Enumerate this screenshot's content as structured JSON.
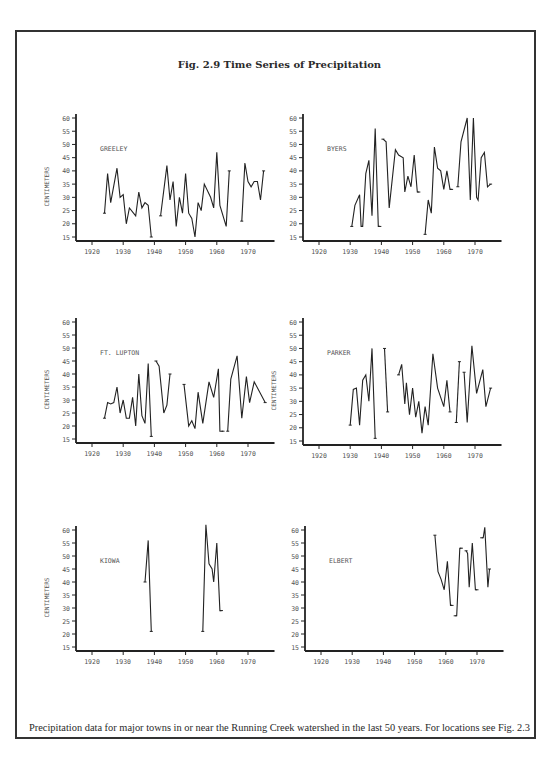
{
  "figure": {
    "title": "Fig. 2.9 Time Series of Precipitation",
    "caption": "Precipitation data for major towns in or near the Running Creek watershed in the last 50 years. For locations see Fig. 2.3"
  },
  "chart_data": [
    {
      "type": "line",
      "title": "GREELEY",
      "xlabel": "",
      "ylabel": "CENTIMETERS",
      "show_ylabel": true,
      "xlim": [
        1915,
        1978
      ],
      "ylim": [
        13,
        61
      ],
      "xticks": [
        1920,
        1930,
        1940,
        1950,
        1960,
        1970
      ],
      "yticks": [
        15,
        20,
        25,
        30,
        35,
        40,
        45,
        50,
        55,
        60
      ],
      "grid": false,
      "segments": [
        [
          [
            1924,
            24
          ],
          [
            1925,
            39
          ],
          [
            1926,
            28
          ],
          [
            1928,
            41
          ],
          [
            1929,
            30
          ],
          [
            1930,
            31
          ],
          [
            1931,
            20
          ],
          [
            1932,
            26
          ],
          [
            1934,
            23
          ],
          [
            1935,
            32
          ],
          [
            1936,
            26
          ],
          [
            1937,
            28
          ],
          [
            1938,
            27
          ],
          [
            1939,
            15
          ]
        ],
        [
          [
            1942,
            23
          ],
          [
            1944,
            42
          ],
          [
            1945,
            29
          ],
          [
            1946,
            36
          ],
          [
            1947,
            19
          ],
          [
            1948,
            30
          ],
          [
            1949,
            24
          ],
          [
            1950,
            39
          ],
          [
            1951,
            24
          ],
          [
            1952,
            22
          ],
          [
            1953,
            15
          ],
          [
            1954,
            28
          ],
          [
            1955,
            25
          ],
          [
            1956,
            35
          ],
          [
            1958,
            30
          ],
          [
            1959,
            26
          ],
          [
            1960,
            47
          ],
          [
            1961,
            27
          ],
          [
            1963,
            19
          ],
          [
            1964,
            40
          ]
        ],
        [
          [
            1968,
            21
          ],
          [
            1969,
            43
          ],
          [
            1970,
            36
          ],
          [
            1971,
            34
          ],
          [
            1972,
            36
          ],
          [
            1973,
            36
          ],
          [
            1974,
            29
          ],
          [
            1975,
            40
          ]
        ]
      ]
    },
    {
      "type": "line",
      "title": "BYERS",
      "xlabel": "",
      "ylabel": "",
      "show_ylabel": false,
      "xlim": [
        1915,
        1978
      ],
      "ylim": [
        13,
        61
      ],
      "xticks": [
        1920,
        1930,
        1940,
        1950,
        1960,
        1970
      ],
      "yticks": [
        15,
        20,
        25,
        30,
        35,
        40,
        45,
        50,
        55,
        60
      ],
      "grid": false,
      "segments": [
        [
          [
            1930.5,
            19
          ],
          [
            1931.5,
            27
          ],
          [
            1933,
            31
          ],
          [
            1933.5,
            19
          ],
          [
            1934,
            19
          ],
          [
            1935,
            39
          ],
          [
            1936,
            44
          ],
          [
            1937,
            23
          ],
          [
            1938,
            56
          ],
          [
            1939,
            19
          ],
          [
            1939.5,
            19
          ]
        ],
        [
          [
            1940.5,
            52
          ],
          [
            1941.5,
            51
          ],
          [
            1942.5,
            26
          ],
          [
            1944.5,
            48
          ],
          [
            1945.5,
            46
          ],
          [
            1947,
            45
          ],
          [
            1947.5,
            32
          ],
          [
            1948.5,
            38
          ],
          [
            1949.5,
            34
          ],
          [
            1950.5,
            46
          ],
          [
            1951.5,
            32
          ],
          [
            1952,
            32
          ]
        ],
        [
          [
            1954,
            16
          ],
          [
            1955,
            29
          ],
          [
            1956,
            24
          ],
          [
            1957,
            49
          ],
          [
            1958,
            41
          ],
          [
            1959,
            40
          ],
          [
            1960,
            33
          ],
          [
            1961,
            40
          ],
          [
            1962,
            33
          ],
          [
            1962.5,
            33
          ]
        ],
        [
          [
            1964.5,
            34
          ],
          [
            1965.5,
            51
          ],
          [
            1967.5,
            60
          ],
          [
            1968.5,
            29
          ],
          [
            1969.5,
            60
          ],
          [
            1970.5,
            30
          ],
          [
            1971,
            29
          ],
          [
            1972,
            45
          ],
          [
            1973,
            47
          ],
          [
            1974,
            34
          ],
          [
            1975,
            35
          ]
        ]
      ]
    },
    {
      "type": "line",
      "title": "FT. LUPTON",
      "xlabel": "",
      "ylabel": "CENTIMETERS",
      "show_ylabel": true,
      "xlim": [
        1915,
        1978
      ],
      "ylim": [
        13,
        61
      ],
      "xticks": [
        1920,
        1930,
        1940,
        1950,
        1960,
        1970
      ],
      "yticks": [
        15,
        20,
        25,
        30,
        35,
        40,
        45,
        50,
        55,
        60
      ],
      "grid": false,
      "segments": [
        [
          [
            1924,
            23
          ],
          [
            1925,
            29
          ],
          [
            1926,
            28.5
          ],
          [
            1927,
            29
          ],
          [
            1928,
            35
          ],
          [
            1929,
            25
          ],
          [
            1930,
            30
          ],
          [
            1931,
            23
          ],
          [
            1932,
            23
          ],
          [
            1933,
            31
          ],
          [
            1934,
            20
          ],
          [
            1935,
            40
          ],
          [
            1936,
            24
          ],
          [
            1937,
            21
          ],
          [
            1938,
            44
          ],
          [
            1939,
            16
          ]
        ],
        [
          [
            1940.5,
            45
          ],
          [
            1941.5,
            43
          ],
          [
            1943,
            25
          ],
          [
            1944,
            28
          ],
          [
            1945,
            40
          ]
        ],
        [
          [
            1949.5,
            36
          ],
          [
            1951,
            20
          ],
          [
            1952,
            22
          ],
          [
            1953,
            19
          ],
          [
            1954,
            33
          ],
          [
            1955.5,
            21
          ],
          [
            1957.5,
            37
          ],
          [
            1959,
            31
          ],
          [
            1960.5,
            42
          ],
          [
            1961,
            18
          ],
          [
            1962,
            18
          ]
        ],
        [
          [
            1963.5,
            18
          ],
          [
            1964.5,
            38
          ],
          [
            1966.5,
            47
          ],
          [
            1968,
            23
          ],
          [
            1969.5,
            39
          ],
          [
            1970.5,
            29
          ],
          [
            1972,
            37
          ],
          [
            1975.5,
            29
          ]
        ]
      ]
    },
    {
      "type": "line",
      "title": "PARKER",
      "xlabel": "",
      "ylabel": "CENTIMETERS",
      "show_ylabel": true,
      "xlim": [
        1915,
        1978
      ],
      "ylim": [
        13,
        61
      ],
      "xticks": [
        1920,
        1930,
        1940,
        1950,
        1960,
        1970
      ],
      "xtick_labels": [
        "1920",
        "1930",
        "1940",
        "1950",
        "1960",
        "1970"
      ],
      "yticks": [
        15,
        20,
        25,
        30,
        35,
        40,
        45,
        50,
        55,
        60
      ],
      "grid": false,
      "segments": [
        [
          [
            1930,
            21
          ],
          [
            1931,
            34.5
          ],
          [
            1932,
            35
          ],
          [
            1933,
            21
          ],
          [
            1934,
            38
          ],
          [
            1935,
            40
          ],
          [
            1936,
            30
          ],
          [
            1937,
            50
          ],
          [
            1938,
            16
          ]
        ],
        [
          [
            1941,
            50
          ],
          [
            1942,
            26
          ]
        ],
        [
          [
            1945.5,
            40
          ],
          [
            1946.5,
            44
          ],
          [
            1947.5,
            29
          ],
          [
            1948,
            37
          ],
          [
            1949,
            25
          ],
          [
            1950,
            35
          ],
          [
            1951,
            24
          ],
          [
            1952,
            30
          ],
          [
            1953,
            18
          ],
          [
            1954,
            28
          ],
          [
            1955,
            21
          ],
          [
            1956.5,
            48
          ],
          [
            1958,
            35
          ],
          [
            1960,
            28
          ],
          [
            1961,
            38
          ],
          [
            1962,
            26
          ]
        ],
        [
          [
            1964,
            22
          ],
          [
            1965,
            45
          ]
        ],
        [
          [
            1966.5,
            41
          ],
          [
            1967.5,
            22
          ],
          [
            1969,
            51
          ],
          [
            1970.5,
            33
          ],
          [
            1972.5,
            42
          ],
          [
            1973.5,
            28
          ],
          [
            1975,
            35
          ]
        ]
      ]
    },
    {
      "type": "line",
      "title": "KIOWA",
      "xlabel": "",
      "ylabel": "CENTIMETERS",
      "show_ylabel": true,
      "xlim": [
        1915,
        1978
      ],
      "ylim": [
        13,
        61
      ],
      "xticks": [
        1920,
        1930,
        1940,
        1950,
        1960,
        1970
      ],
      "yticks": [
        15,
        20,
        25,
        30,
        35,
        40,
        45,
        50,
        55,
        60
      ],
      "grid": false,
      "segments": [
        [
          [
            1937,
            40
          ],
          [
            1938,
            56
          ],
          [
            1939,
            21
          ]
        ],
        [
          [
            1955.5,
            21
          ],
          [
            1956.5,
            62
          ],
          [
            1957.5,
            47
          ],
          [
            1958.5,
            45
          ],
          [
            1959,
            40
          ],
          [
            1960,
            55
          ],
          [
            1961,
            29
          ],
          [
            1961.5,
            29
          ]
        ]
      ]
    },
    {
      "type": "line",
      "title": "ELBERT",
      "xlabel": "",
      "ylabel": "",
      "show_ylabel": false,
      "xlim": [
        1915,
        1978
      ],
      "ylim": [
        13,
        61
      ],
      "xticks": [
        1920,
        1930,
        1940,
        1950,
        1960,
        1970
      ],
      "yticks": [
        15,
        20,
        25,
        30,
        35,
        40,
        45,
        50,
        55,
        60
      ],
      "grid": false,
      "segments": [
        [
          [
            1956.5,
            58
          ],
          [
            1957.5,
            44
          ],
          [
            1958.5,
            41
          ],
          [
            1959.5,
            37
          ],
          [
            1960.5,
            48
          ],
          [
            1961.5,
            31
          ],
          [
            1962,
            31
          ]
        ],
        [
          [
            1963,
            27
          ],
          [
            1963.5,
            27
          ],
          [
            1964.5,
            53
          ],
          [
            1965,
            53
          ]
        ],
        [
          [
            1966.5,
            52
          ],
          [
            1967,
            51
          ],
          [
            1967.5,
            38
          ],
          [
            1968.5,
            55
          ],
          [
            1969.5,
            37
          ],
          [
            1970,
            37
          ]
        ],
        [
          [
            1971.5,
            57
          ],
          [
            1972,
            57
          ],
          [
            1972.5,
            61
          ],
          [
            1973.5,
            38
          ],
          [
            1974,
            45
          ]
        ]
      ]
    }
  ],
  "layout": {
    "panels": [
      {
        "left": 40,
        "top": 110,
        "axis_x": 36,
        "axis_y": 131,
        "width": 240,
        "height": 150
      },
      {
        "left": 268,
        "top": 110,
        "axis_x": 35,
        "axis_y": 131,
        "width": 245,
        "height": 150
      },
      {
        "left": 40,
        "top": 314,
        "axis_x": 36,
        "axis_y": 129,
        "width": 240,
        "height": 150
      },
      {
        "left": 268,
        "top": 314,
        "axis_x": 35,
        "axis_y": 131,
        "width": 245,
        "height": 150
      },
      {
        "left": 40,
        "top": 522,
        "axis_x": 36,
        "axis_y": 129,
        "width": 240,
        "height": 150
      },
      {
        "left": 268,
        "top": 522,
        "axis_x": 37,
        "axis_y": 129,
        "width": 245,
        "height": 150
      }
    ]
  }
}
